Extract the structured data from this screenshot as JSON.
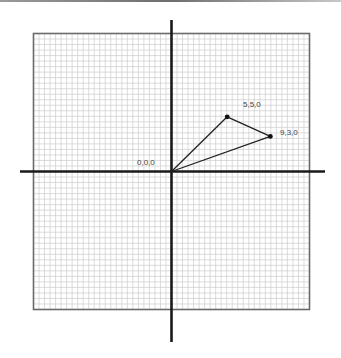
{
  "diagram": {
    "type": "coordinate-grid-vector-triangle",
    "grid": {
      "cells_per_side": 25,
      "cells_per_unit": 2,
      "line_color": "#c4c4c4",
      "border_color": "#6a6a6a"
    },
    "axes": {
      "color": "#1a1a1a"
    },
    "points": [
      {
        "id": "origin",
        "x": 0,
        "y": 0,
        "label": "0,0,0"
      },
      {
        "id": "p1",
        "x": 5,
        "y": 5,
        "label": "5,5,0"
      },
      {
        "id": "p2",
        "x": 9,
        "y": 3,
        "label": "9,3,0"
      }
    ],
    "edges": [
      [
        "origin",
        "p1"
      ],
      [
        "p1",
        "p2"
      ],
      [
        "p2",
        "origin"
      ]
    ],
    "line_color": "#222222"
  }
}
